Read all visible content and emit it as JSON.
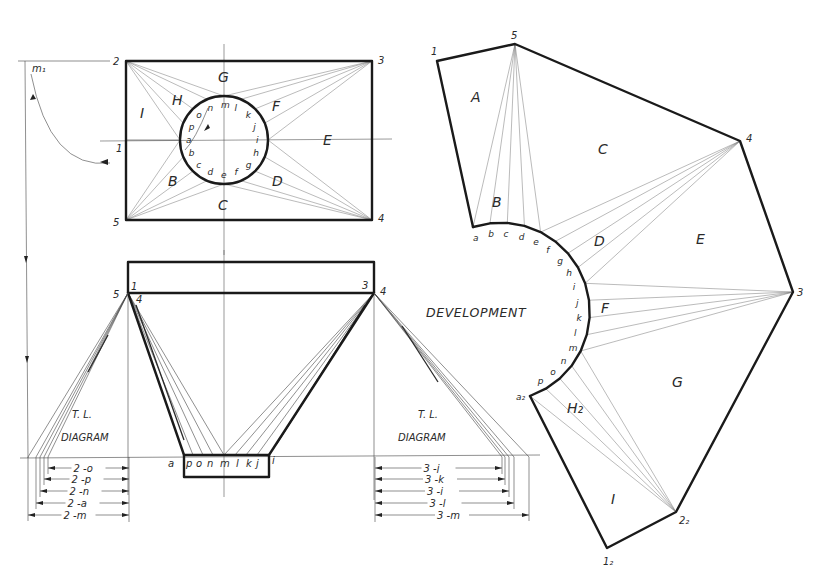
{
  "figure": {
    "top_view": {
      "corner_labels": [
        "1",
        "2",
        "3",
        "4",
        "5"
      ],
      "surface_labels": [
        "G",
        "H",
        "I",
        "E",
        "F",
        "B",
        "C",
        "D"
      ],
      "circle_point_labels": [
        "a",
        "b",
        "c",
        "d",
        "e",
        "f",
        "g",
        "h",
        "i",
        "j",
        "k",
        "l",
        "m",
        "n",
        "o",
        "p"
      ],
      "revolution_label": "m₁"
    },
    "front_view": {
      "corner_labels": {
        "left_outer": "5",
        "left_top": "1",
        "left_inner": "4",
        "right_top": "3",
        "right_outer": "4"
      },
      "bottom_point_labels": [
        "a",
        "p",
        "o",
        "n",
        "m",
        "l",
        "k",
        "j",
        "i"
      ]
    },
    "tl_diagram_left": {
      "title_line1": "T. L.",
      "title_line2": "DIAGRAM",
      "dimensions": [
        "2 -o",
        "2 -p",
        "2 -n",
        "2 -a",
        "2 -m"
      ]
    },
    "tl_diagram_right": {
      "title_line1": "T. L.",
      "title_line2": "DIAGRAM",
      "dimensions": [
        "3 -j",
        "3 -k",
        "3 -i",
        "3 -l",
        "3 -m"
      ]
    },
    "development": {
      "title": "DEVELOPMENT",
      "vertex_labels": {
        "v1": "1",
        "v5": "5",
        "v4": "4",
        "v3": "3",
        "v2_2": "2₂",
        "v1_2": "1₂",
        "a2": "a₂"
      },
      "surface_labels": [
        "A",
        "B",
        "C",
        "D",
        "E",
        "F",
        "G",
        "H₂",
        "I"
      ],
      "arc_point_labels": [
        "a",
        "b",
        "c",
        "d",
        "e",
        "f",
        "g",
        "h",
        "i",
        "j",
        "k",
        "l",
        "m",
        "n",
        "o",
        "p"
      ]
    }
  }
}
